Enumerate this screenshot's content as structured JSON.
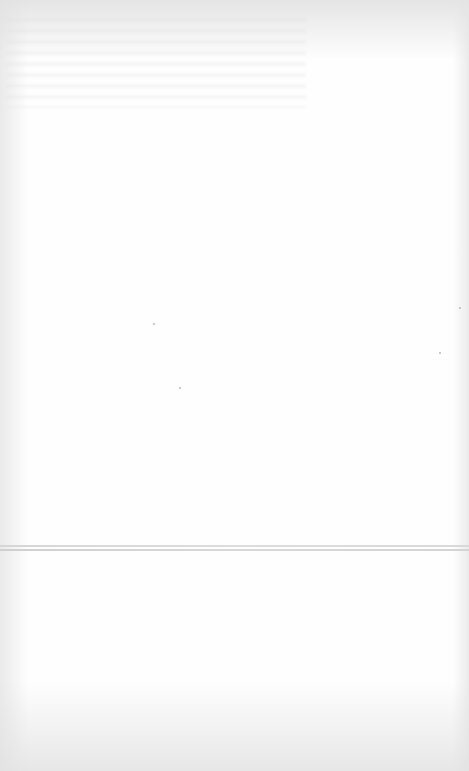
{
  "page": {
    "type": "blank-sheet",
    "background_color": "#fefefe",
    "edge_shadow_color": "#dcdcdc",
    "crease_color": "#d6d6d6"
  },
  "specks": [
    {
      "x": 153,
      "y": 323
    },
    {
      "x": 179,
      "y": 387
    },
    {
      "x": 459,
      "y": 307
    },
    {
      "x": 439,
      "y": 352
    }
  ]
}
